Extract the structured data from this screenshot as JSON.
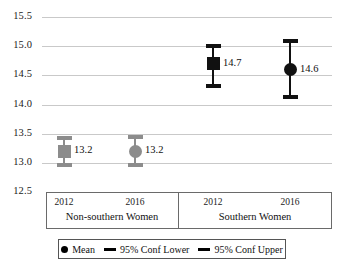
{
  "chart_data": {
    "type": "scatter",
    "title": "",
    "xlabel": "",
    "ylabel": "",
    "ylim": [
      12.5,
      15.5
    ],
    "ytick_step": 0.5,
    "grid": true,
    "legend_position": "bottom",
    "yticks": [
      "15.5",
      "15.0",
      "14.5",
      "14.0",
      "13.5",
      "13.0",
      "12.5"
    ],
    "groups": [
      {
        "name": "Non-southern Women",
        "points": [
          {
            "category": "2012",
            "marker": "square",
            "color": "#8c8c8c",
            "mean": 13.2,
            "label": "13.2",
            "conf_upper": 13.42,
            "conf_lower": 12.97
          },
          {
            "category": "2016",
            "marker": "circle",
            "color": "#8c8c8c",
            "mean": 13.2,
            "label": "13.2",
            "conf_upper": 13.44,
            "conf_lower": 12.96
          }
        ]
      },
      {
        "name": "Southern Women",
        "points": [
          {
            "category": "2012",
            "marker": "square",
            "color": "#111111",
            "mean": 14.7,
            "label": "14.7",
            "conf_upper": 15.0,
            "conf_lower": 14.32
          },
          {
            "category": "2016",
            "marker": "circle",
            "color": "#111111",
            "mean": 14.6,
            "label": "14.6",
            "conf_upper": 15.09,
            "conf_lower": 14.13
          }
        ]
      }
    ],
    "legend": [
      {
        "label": "Mean",
        "glyph": "dot-icon"
      },
      {
        "label": "95% Conf Lower",
        "glyph": "dash-icon"
      },
      {
        "label": "95% Conf Upper",
        "glyph": "dash-icon"
      }
    ]
  }
}
